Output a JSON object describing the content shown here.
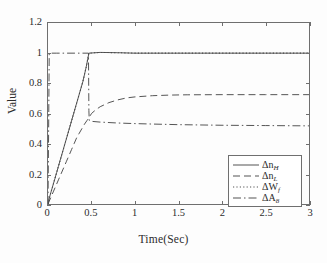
{
  "chart_data": {
    "type": "line",
    "title": "",
    "xlabel": "Time(Sec)",
    "ylabel": "Value",
    "xlim": [
      0,
      3
    ],
    "ylim": [
      0,
      1.2
    ],
    "xticks": [
      "0",
      "0.5",
      "1",
      "1.5",
      "2",
      "2.5",
      "3"
    ],
    "yticks": [
      "0",
      "0.2",
      "0.4",
      "0.6",
      "0.8",
      "1",
      "1.2"
    ],
    "grid": false,
    "legend_position": "lower-right-inside",
    "series": [
      {
        "name": "dn_H",
        "legend_base": "Δn",
        "legend_sub": "H",
        "style": "solid",
        "steady_state": 1.0,
        "points": [
          [
            0.0,
            0.0
          ],
          [
            0.02,
            0.05
          ],
          [
            0.04,
            0.09
          ],
          [
            0.06,
            0.13
          ],
          [
            0.08,
            0.17
          ],
          [
            0.1,
            0.21
          ],
          [
            0.12,
            0.25
          ],
          [
            0.14,
            0.29
          ],
          [
            0.16,
            0.33
          ],
          [
            0.18,
            0.37
          ],
          [
            0.2,
            0.41
          ],
          [
            0.22,
            0.45
          ],
          [
            0.24,
            0.49
          ],
          [
            0.26,
            0.53
          ],
          [
            0.28,
            0.57
          ],
          [
            0.3,
            0.61
          ],
          [
            0.32,
            0.65
          ],
          [
            0.34,
            0.69
          ],
          [
            0.36,
            0.73
          ],
          [
            0.38,
            0.77
          ],
          [
            0.4,
            0.81
          ],
          [
            0.42,
            0.86
          ],
          [
            0.44,
            0.91
          ],
          [
            0.46,
            0.97
          ],
          [
            0.47,
            1.0
          ],
          [
            0.6,
            1.005
          ],
          [
            0.8,
            1.003
          ],
          [
            1.0,
            1.0
          ],
          [
            1.5,
            1.0
          ],
          [
            2.0,
            1.0
          ],
          [
            2.5,
            1.0
          ],
          [
            3.0,
            1.0
          ]
        ]
      },
      {
        "name": "dn_L",
        "legend_base": "Δn",
        "legend_sub": "L",
        "style": "dashed",
        "steady_state": 0.72,
        "points": [
          [
            0.0,
            0.0
          ],
          [
            0.03,
            0.04
          ],
          [
            0.06,
            0.08
          ],
          [
            0.09,
            0.12
          ],
          [
            0.12,
            0.16
          ],
          [
            0.15,
            0.2
          ],
          [
            0.18,
            0.24
          ],
          [
            0.21,
            0.28
          ],
          [
            0.24,
            0.32
          ],
          [
            0.27,
            0.36
          ],
          [
            0.3,
            0.4
          ],
          [
            0.33,
            0.44
          ],
          [
            0.36,
            0.47
          ],
          [
            0.39,
            0.5
          ],
          [
            0.42,
            0.53
          ],
          [
            0.45,
            0.555
          ],
          [
            0.47,
            0.57
          ],
          [
            0.5,
            0.6
          ],
          [
            0.55,
            0.625
          ],
          [
            0.6,
            0.645
          ],
          [
            0.7,
            0.672
          ],
          [
            0.8,
            0.69
          ],
          [
            0.9,
            0.703
          ],
          [
            1.0,
            0.71
          ],
          [
            1.2,
            0.718
          ],
          [
            1.4,
            0.722
          ],
          [
            1.6,
            0.724
          ],
          [
            2.0,
            0.725
          ],
          [
            2.5,
            0.725
          ],
          [
            3.0,
            0.725
          ]
        ]
      },
      {
        "name": "dW_f",
        "legend_base": "ΔW",
        "legend_sub": "f",
        "style": "dotted",
        "steady_state": 1.0,
        "points": [
          [
            0.0,
            0.0
          ],
          [
            0.02,
            0.05
          ],
          [
            0.04,
            0.09
          ],
          [
            0.06,
            0.13
          ],
          [
            0.08,
            0.17
          ],
          [
            0.1,
            0.21
          ],
          [
            0.12,
            0.25
          ],
          [
            0.14,
            0.29
          ],
          [
            0.16,
            0.33
          ],
          [
            0.18,
            0.37
          ],
          [
            0.2,
            0.41
          ],
          [
            0.22,
            0.45
          ],
          [
            0.24,
            0.49
          ],
          [
            0.26,
            0.53
          ],
          [
            0.28,
            0.57
          ],
          [
            0.3,
            0.61
          ],
          [
            0.32,
            0.65
          ],
          [
            0.34,
            0.69
          ],
          [
            0.36,
            0.73
          ],
          [
            0.38,
            0.77
          ],
          [
            0.4,
            0.81
          ],
          [
            0.42,
            0.86
          ],
          [
            0.44,
            0.91
          ],
          [
            0.46,
            0.97
          ],
          [
            0.47,
            1.0
          ],
          [
            0.6,
            1.005
          ],
          [
            0.8,
            1.003
          ],
          [
            1.0,
            1.0
          ],
          [
            1.5,
            1.0
          ],
          [
            2.0,
            1.0
          ],
          [
            2.5,
            1.0
          ],
          [
            3.0,
            1.0
          ]
        ]
      },
      {
        "name": "dA_8",
        "legend_base": "ΔA",
        "legend_sub": "8",
        "style": "dashdot",
        "steady_state": 0.52,
        "points": [
          [
            0.0,
            0.0
          ],
          [
            0.008,
            0.55
          ],
          [
            0.014,
            1.0
          ],
          [
            0.1,
            1.0
          ],
          [
            0.2,
            1.0
          ],
          [
            0.3,
            1.0
          ],
          [
            0.4,
            1.0
          ],
          [
            0.465,
            1.0
          ],
          [
            0.47,
            0.62
          ],
          [
            0.474,
            0.555
          ],
          [
            0.5,
            0.548
          ],
          [
            0.6,
            0.543
          ],
          [
            0.8,
            0.537
          ],
          [
            1.0,
            0.533
          ],
          [
            1.2,
            0.53
          ],
          [
            1.5,
            0.526
          ],
          [
            2.0,
            0.522
          ],
          [
            2.5,
            0.52
          ],
          [
            3.0,
            0.518
          ]
        ]
      }
    ]
  }
}
